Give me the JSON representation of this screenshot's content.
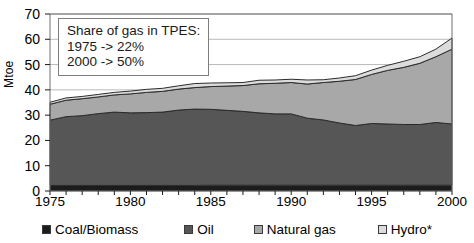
{
  "chart_data": {
    "type": "area",
    "stacked": true,
    "title": "",
    "xlabel": "",
    "ylabel": "Mtoe",
    "xlim": [
      1975,
      2000
    ],
    "ylim": [
      0,
      70
    ],
    "ytick_values": [
      0,
      10,
      20,
      30,
      40,
      50,
      60,
      70
    ],
    "ytick_labels": [
      "0",
      "10",
      "20",
      "30",
      "40",
      "50",
      "60",
      "70"
    ],
    "xtick_values": [
      1975,
      1980,
      1985,
      1990,
      1995,
      2000
    ],
    "xtick_labels": [
      "1975",
      "1980",
      "1985",
      "1990",
      "1995",
      "2000"
    ],
    "grid": true,
    "grid_axis": "y",
    "legend_position": "bottom",
    "x": [
      1975,
      1976,
      1977,
      1978,
      1979,
      1980,
      1981,
      1982,
      1983,
      1984,
      1985,
      1986,
      1987,
      1988,
      1989,
      1990,
      1991,
      1992,
      1993,
      1994,
      1995,
      1996,
      1997,
      1998,
      1999,
      2000
    ],
    "series": [
      {
        "name": "Coal/Biomass",
        "color": "#1c1c1c",
        "values": [
          2.2,
          2.2,
          2.2,
          2.2,
          2.2,
          2.2,
          2.2,
          2.2,
          2.2,
          2.2,
          2.3,
          2.3,
          2.3,
          2.3,
          2.3,
          2.3,
          2.3,
          2.3,
          2.3,
          2.3,
          2.3,
          2.3,
          2.3,
          2.3,
          2.3,
          2.3
        ]
      },
      {
        "name": "Oil",
        "color": "#565656",
        "values": [
          25.8,
          27.2,
          27.6,
          28.4,
          29.0,
          28.7,
          28.8,
          29.0,
          29.8,
          30.2,
          30.0,
          29.6,
          29.2,
          28.6,
          28.2,
          28.2,
          26.5,
          25.8,
          24.6,
          23.6,
          24.4,
          24.2,
          24.0,
          24.0,
          24.8,
          24.2
        ]
      },
      {
        "name": "Natural gas",
        "color": "#a8a8a8",
        "values": [
          6.3,
          6.5,
          6.7,
          6.6,
          6.8,
          7.5,
          8.0,
          8.2,
          8.3,
          8.5,
          9.0,
          9.6,
          10.2,
          11.5,
          12.1,
          12.4,
          13.5,
          14.8,
          16.5,
          18.2,
          19.4,
          21.2,
          22.6,
          24.2,
          26.0,
          29.6
        ]
      },
      {
        "name": "Hydro*",
        "color": "#dcdcdc",
        "values": [
          0.8,
          0.9,
          0.9,
          1.0,
          1.0,
          1.1,
          1.2,
          1.2,
          1.3,
          1.6,
          1.4,
          1.3,
          1.2,
          1.4,
          1.3,
          1.3,
          1.6,
          1.1,
          1.3,
          1.5,
          1.7,
          2.0,
          2.4,
          2.6,
          3.0,
          4.4
        ]
      }
    ],
    "annotation": {
      "lines": [
        "Share of gas in TPES:",
        "1975 -> 22%",
        "2000 -> 50%"
      ]
    }
  }
}
